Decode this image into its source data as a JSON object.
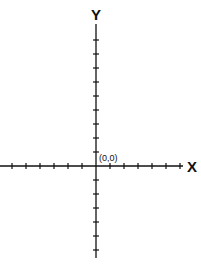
{
  "diagram": {
    "type": "cartesian-axes",
    "x_axis_label": "X",
    "y_axis_label": "Y",
    "origin_label": "(0,0)",
    "colors": {
      "axis": "#111111",
      "background": "#ffffff"
    },
    "ticks": {
      "x_negative": 6,
      "x_positive": 6,
      "y_positive": 9,
      "y_negative": 6,
      "spacing_px": 14
    }
  }
}
